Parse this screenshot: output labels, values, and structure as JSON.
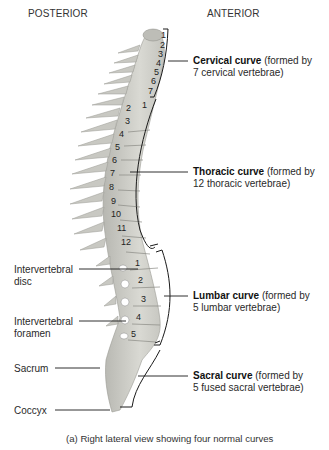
{
  "headers": {
    "posterior": "POSTERIOR",
    "anterior": "ANTERIOR"
  },
  "curves": [
    {
      "name": "Cervical curve",
      "desc": "(formed by",
      "desc2": "7 cervical vertebrae)"
    },
    {
      "name": "Thoracic curve",
      "desc": "(formed by",
      "desc2": "12 thoracic vertebrae)"
    },
    {
      "name": "Lumbar curve",
      "desc": "(formed by",
      "desc2": "5 lumbar vertebrae)"
    },
    {
      "name": "Sacral curve",
      "desc": "(formed by",
      "desc2": "5 fused sacral vertebrae)"
    }
  ],
  "left_labels": [
    {
      "line1": "Intervertebral",
      "line2": "disc"
    },
    {
      "line1": "Intervertebral",
      "line2": "foramen"
    },
    {
      "line1": "Sacrum"
    },
    {
      "line1": "Coccyx"
    }
  ],
  "vertebra_numbers": {
    "cervical": [
      "1",
      "2",
      "3",
      "4",
      "5",
      "6",
      "7"
    ],
    "thoracic": [
      "1",
      "2",
      "3",
      "4",
      "5",
      "6",
      "7",
      "8",
      "9",
      "10",
      "11",
      "12"
    ],
    "lumbar": [
      "1",
      "2",
      "3",
      "4",
      "5"
    ]
  },
  "caption": "(a) Right lateral view showing four normal curves",
  "colors": {
    "bone": "#d6d6d0",
    "bone_shadow": "#a9a9a3",
    "line": "#1a1a1a"
  }
}
